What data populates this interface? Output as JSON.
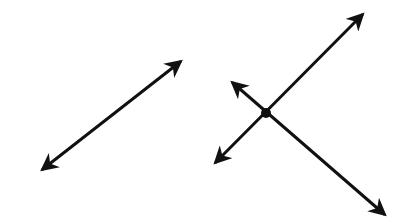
{
  "figure": {
    "stroke_color": "#111111",
    "background": "#ffffff",
    "elements": [
      {
        "type": "line",
        "name": "standalone-line",
        "x1": 43,
        "y1": 169,
        "x2": 180,
        "y2": 62,
        "arrows": "both"
      },
      {
        "type": "line",
        "name": "line-a",
        "x1": 216,
        "y1": 162,
        "x2": 362,
        "y2": 15,
        "arrows": "both"
      },
      {
        "type": "line",
        "name": "line-b",
        "x1": 233,
        "y1": 83,
        "x2": 384,
        "y2": 214,
        "arrows": "both"
      },
      {
        "type": "point",
        "name": "intersection-point",
        "cx": 266,
        "cy": 113
      }
    ]
  }
}
